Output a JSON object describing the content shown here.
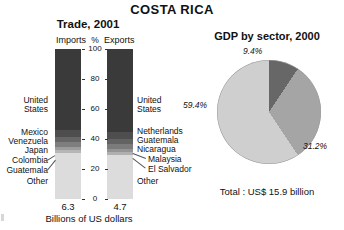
{
  "page": {
    "main_title": "COSTA RICA"
  },
  "trade_chart": {
    "title": "Trade, 2001",
    "imports_header": "Imports",
    "percent_header": "%",
    "exports_header": "Exports",
    "axis_label": "Billions of US dollars",
    "imports_value": "6.3",
    "exports_value": "4.7",
    "axis_ticks": [
      "100",
      "80",
      "60",
      "40",
      "20",
      "0"
    ],
    "imports_labels": {
      "united_states": "United\nStates",
      "mexico": "Mexico",
      "venezuela": "Venezuela",
      "japan": "Japan",
      "colombia": "Colombia",
      "guatemala": "Guatemala",
      "other": "Other"
    },
    "exports_labels": {
      "united_states": "United\nStates",
      "netherlands": "Netherlands",
      "guatemala": "Guatemala",
      "nicaragua": "Nicaragua",
      "malaysia": "Malaysia",
      "el_salvador": "El Salvador",
      "other": "Other"
    }
  },
  "gdp_chart": {
    "title": "GDP by sector, 2000",
    "total": "Total : US$ 15.9 billion",
    "slice_labels": [
      "9.4%",
      "31.2%",
      "59.4%"
    ]
  },
  "chart_data": [
    {
      "type": "bar",
      "title": "Trade, 2001",
      "subtype": "stacked-100-percent",
      "xlabel": "Billions of US dollars",
      "ylabel": "%",
      "ylim": [
        0,
        100
      ],
      "grid": false,
      "categories": [
        "Imports",
        "Exports"
      ],
      "category_totals": [
        "6.3",
        "4.7"
      ],
      "yticks": [
        0,
        20,
        40,
        60,
        80,
        100
      ],
      "stacks": [
        {
          "category": "Imports",
          "total_billions_usd": 6.3,
          "segments": [
            {
              "name": "United States",
              "value": 54.0,
              "color": "#3a3a3a"
            },
            {
              "name": "Mexico",
              "value": 4.5,
              "color": "#4e4e4e"
            },
            {
              "name": "Venezuela",
              "value": 3.5,
              "color": "#666666"
            },
            {
              "name": "Japan",
              "value": 3.5,
              "color": "#7e7e7e"
            },
            {
              "name": "Colombia",
              "value": 2.0,
              "color": "#9c9c9c"
            },
            {
              "name": "Guatemala",
              "value": 2.0,
              "color": "#b6b6b6"
            },
            {
              "name": "Other",
              "value": 30.5,
              "color": "#dcdcdc"
            }
          ]
        },
        {
          "category": "Exports",
          "total_billions_usd": 4.7,
          "segments": [
            {
              "name": "United States",
              "value": 55.0,
              "color": "#3a3a3a"
            },
            {
              "name": "Netherlands",
              "value": 5.0,
              "color": "#4e4e4e"
            },
            {
              "name": "Guatemala",
              "value": 3.5,
              "color": "#636363"
            },
            {
              "name": "Nicaragua",
              "value": 3.0,
              "color": "#7b7b7b"
            },
            {
              "name": "Malaysia",
              "value": 2.0,
              "color": "#959595"
            },
            {
              "name": "El Salvador",
              "value": 2.0,
              "color": "#b0b0b0"
            },
            {
              "name": "Other",
              "value": 29.5,
              "color": "#dcdcdc"
            }
          ]
        }
      ]
    },
    {
      "type": "pie",
      "title": "GDP by sector, 2000",
      "annotation": "Total : US$ 15.9 billion",
      "labels": [
        "9.4%",
        "31.2%",
        "59.4%"
      ],
      "values": [
        9.4,
        31.2,
        59.4
      ],
      "colors": [
        "#676767",
        "#a5a5a5",
        "#cfcfcf"
      ],
      "start_angle_deg": 0,
      "legend": "none"
    }
  ]
}
